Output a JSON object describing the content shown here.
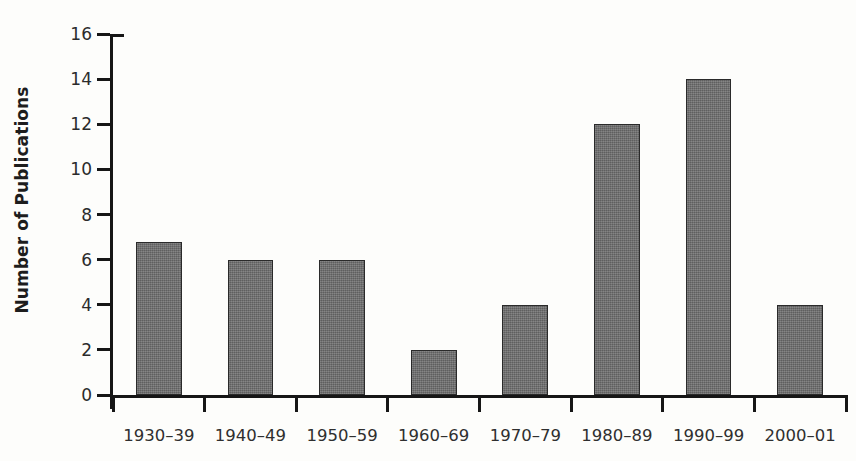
{
  "chart_data": {
    "type": "bar",
    "title": "",
    "subtitle": "",
    "xlabel": "",
    "ylabel": "Number of Publications",
    "categories": [
      "1930–39",
      "1940–49",
      "1950–59",
      "1960–69",
      "1970–79",
      "1980–89",
      "1990–99",
      "2000–01"
    ],
    "values": [
      6.8,
      6,
      6,
      2,
      4,
      12,
      14,
      4
    ],
    "ylim": [
      0,
      16
    ],
    "ytick_values": [
      0,
      2,
      4,
      6,
      8,
      10,
      12,
      14,
      16
    ],
    "ytick_labels": [
      "0",
      "2",
      "4",
      "6",
      "8",
      "10",
      "12",
      "14",
      "16"
    ],
    "grid": false,
    "legend": false,
    "legend_position": "none",
    "bar_color": "#6e6e6e",
    "bar_edge_color": "#2a2a2a",
    "axis_color": "#161616",
    "background_color": "#fdfdfb",
    "tick_direction": "out",
    "annotations": []
  }
}
